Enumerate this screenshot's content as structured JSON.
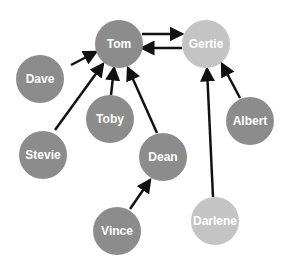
{
  "colors": {
    "dark": "#8c8c8c",
    "light": "#c4c4c4",
    "edge": "#111111"
  },
  "nodes": [
    {
      "id": "tom",
      "label": "Tom",
      "x": 119,
      "y": 44,
      "r": 24,
      "shade": "dark"
    },
    {
      "id": "gertie",
      "label": "Gertie",
      "x": 206,
      "y": 44,
      "r": 24,
      "shade": "light"
    },
    {
      "id": "dave",
      "label": "Dave",
      "x": 40,
      "y": 79,
      "r": 24,
      "shade": "dark"
    },
    {
      "id": "toby",
      "label": "Toby",
      "x": 110,
      "y": 119,
      "r": 24,
      "shade": "dark"
    },
    {
      "id": "albert",
      "label": "Albert",
      "x": 250,
      "y": 121,
      "r": 24,
      "shade": "dark"
    },
    {
      "id": "stevie",
      "label": "Stevie",
      "x": 43,
      "y": 155,
      "r": 24,
      "shade": "dark"
    },
    {
      "id": "dean",
      "label": "Dean",
      "x": 163,
      "y": 157,
      "r": 24,
      "shade": "dark"
    },
    {
      "id": "vince",
      "label": "Vince",
      "x": 117,
      "y": 231,
      "r": 24,
      "shade": "dark"
    },
    {
      "id": "darlene",
      "label": "Darlene",
      "x": 215,
      "y": 221,
      "r": 24,
      "shade": "light"
    }
  ],
  "edges": [
    {
      "from": "tom",
      "to": "gertie",
      "x1": 142,
      "y1": 34,
      "x2": 182,
      "y2": 34
    },
    {
      "from": "gertie",
      "to": "tom",
      "x1": 182,
      "y1": 48,
      "x2": 142,
      "y2": 48
    },
    {
      "from": "dave",
      "to": "tom",
      "x1": 71,
      "y1": 65,
      "x2": 96,
      "y2": 52
    },
    {
      "from": "stevie",
      "to": "tom",
      "x1": 55,
      "y1": 130,
      "x2": 103,
      "y2": 64
    },
    {
      "from": "toby",
      "to": "tom",
      "x1": 111,
      "y1": 95,
      "x2": 114,
      "y2": 68
    },
    {
      "from": "dean",
      "to": "tom",
      "x1": 157,
      "y1": 133,
      "x2": 128,
      "y2": 68
    },
    {
      "from": "vince",
      "to": "dean",
      "x1": 130,
      "y1": 209,
      "x2": 150,
      "y2": 180
    },
    {
      "from": "darlene",
      "to": "gertie",
      "x1": 213,
      "y1": 197,
      "x2": 207,
      "y2": 69
    },
    {
      "from": "albert",
      "to": "gertie",
      "x1": 240,
      "y1": 98,
      "x2": 222,
      "y2": 64
    }
  ]
}
